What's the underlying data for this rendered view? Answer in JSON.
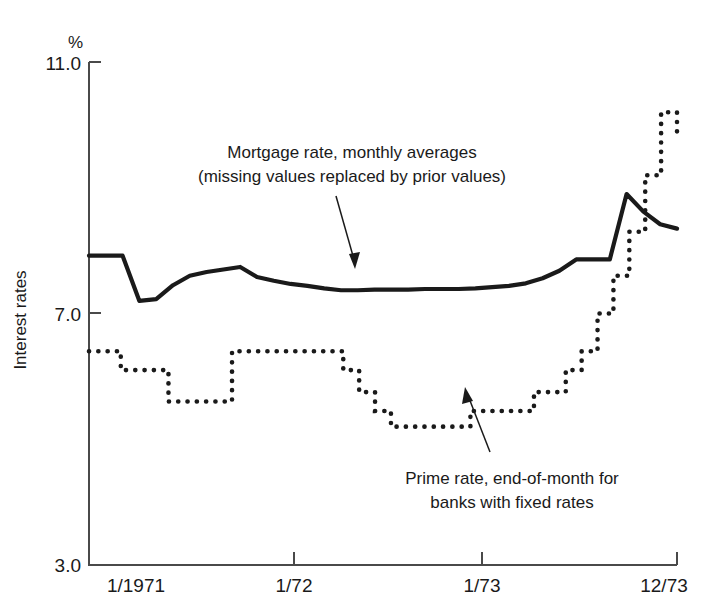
{
  "chart_data": {
    "type": "line",
    "title": "",
    "xlabel": "",
    "ylabel": "Interest rates",
    "yunit": "%",
    "ylim": [
      3.0,
      11.0
    ],
    "yticks": [
      3.0,
      7.0,
      11.0
    ],
    "ytick_labels": [
      "3.0",
      "7.0",
      "11.0"
    ],
    "grid": false,
    "legend_position": "inline-annotations",
    "x_axis_type": "monthly",
    "x_start": "1/1971",
    "x_end": "12/73",
    "xticks": [
      "1/1971",
      "1/72",
      "1/73",
      "12/73"
    ],
    "xtick_months": [
      0,
      12,
      24,
      35
    ],
    "annotations": [
      {
        "name": "mortgage-annotation",
        "lines": [
          "Mortgage rate, monthly averages",
          "(missing values replaced by prior values)"
        ],
        "points_to_month": 14
      },
      {
        "name": "prime-annotation",
        "lines": [
          "Prime rate, end-of-month for",
          "banks with fixed rates"
        ],
        "points_to_month": 22
      }
    ],
    "series": [
      {
        "name": "Mortgage rate, monthly averages",
        "style": "solid",
        "values": [
          7.92,
          7.92,
          7.92,
          7.2,
          7.23,
          7.45,
          7.6,
          7.66,
          7.7,
          7.74,
          7.58,
          7.52,
          7.47,
          7.44,
          7.4,
          7.37,
          7.37,
          7.38,
          7.38,
          7.38,
          7.39,
          7.39,
          7.39,
          7.4,
          7.42,
          7.44,
          7.48,
          7.56,
          7.68,
          7.86,
          7.86,
          7.86,
          8.9,
          8.62,
          8.42,
          8.35
        ]
      },
      {
        "name": "Prime rate, end-of-month for banks with fixed rates",
        "style": "dotted",
        "values": [
          6.4,
          6.4,
          6.1,
          6.1,
          6.1,
          5.6,
          5.6,
          5.6,
          5.6,
          6.4,
          6.4,
          6.4,
          6.4,
          6.4,
          6.4,
          6.4,
          6.1,
          5.75,
          5.45,
          5.2,
          5.2,
          5.2,
          5.2,
          5.2,
          5.45,
          5.45,
          5.45,
          5.45,
          5.75,
          5.75,
          6.1,
          6.4,
          7.0,
          7.6,
          8.3,
          9.2,
          10.2,
          9.8
        ]
      }
    ]
  },
  "figure": {
    "y_unit_label": "%",
    "y_axis_title": "Interest rates",
    "tick_11": "11.0",
    "tick_7": "7.0",
    "tick_3": "3.0",
    "xtick_1": "1/1971",
    "xtick_2": "1/72",
    "xtick_3": "1/73",
    "xtick_4": "12/73",
    "mortgage_line_1": "Mortgage rate, monthly averages",
    "mortgage_line_2": "(missing values replaced by prior values)",
    "prime_line_1": "Prime rate, end-of-month for",
    "prime_line_2": "banks with fixed rates"
  }
}
